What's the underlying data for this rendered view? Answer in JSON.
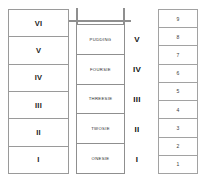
{
  "diagram": {
    "background_color": "#ffffff",
    "border_color": "#9a9a9a",
    "text_color": "#1a1a1a"
  },
  "left_column": {
    "name": "roman-numeral-column",
    "cells": [
      {
        "label": "VI"
      },
      {
        "label": "V"
      },
      {
        "label": "IV"
      },
      {
        "label": "III"
      },
      {
        "label": "II"
      },
      {
        "label": "I"
      }
    ]
  },
  "middle_column": {
    "name": "word-label-column",
    "cells": [
      {
        "label": "PUDDING",
        "numeral": "V"
      },
      {
        "label": "FOURSIE",
        "numeral": "IV"
      },
      {
        "label": "THREESIE",
        "numeral": "III"
      },
      {
        "label": "TWOSIE",
        "numeral": "II"
      },
      {
        "label": "ONESIE",
        "numeral": "I"
      }
    ]
  },
  "right_column": {
    "name": "numbered-column",
    "cells": [
      {
        "label": "9"
      },
      {
        "label": "8"
      },
      {
        "label": "7"
      },
      {
        "label": "6"
      },
      {
        "label": "5"
      },
      {
        "label": "4"
      },
      {
        "label": "3"
      },
      {
        "label": "2"
      },
      {
        "label": "1"
      }
    ]
  }
}
